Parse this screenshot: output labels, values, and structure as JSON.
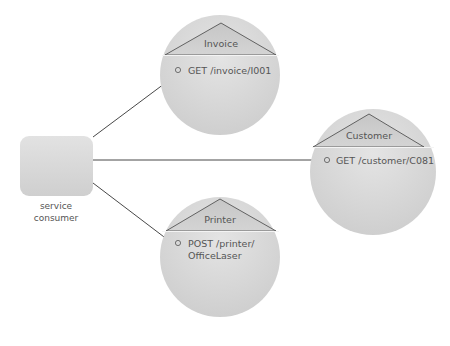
{
  "consumer": {
    "label_line1": "service",
    "label_line2": "consumer"
  },
  "services": [
    {
      "name": "Invoice",
      "operations": [
        "GET /invoice/I001"
      ]
    },
    {
      "name": "Customer",
      "operations": [
        "GET /customer/C081"
      ]
    },
    {
      "name": "Printer",
      "operations": [
        "POST /printer/",
        "OfficeLaser"
      ]
    }
  ],
  "colors": {
    "circle_fill": "#d6d6d6",
    "arrow": "#333333",
    "text": "#555555"
  }
}
